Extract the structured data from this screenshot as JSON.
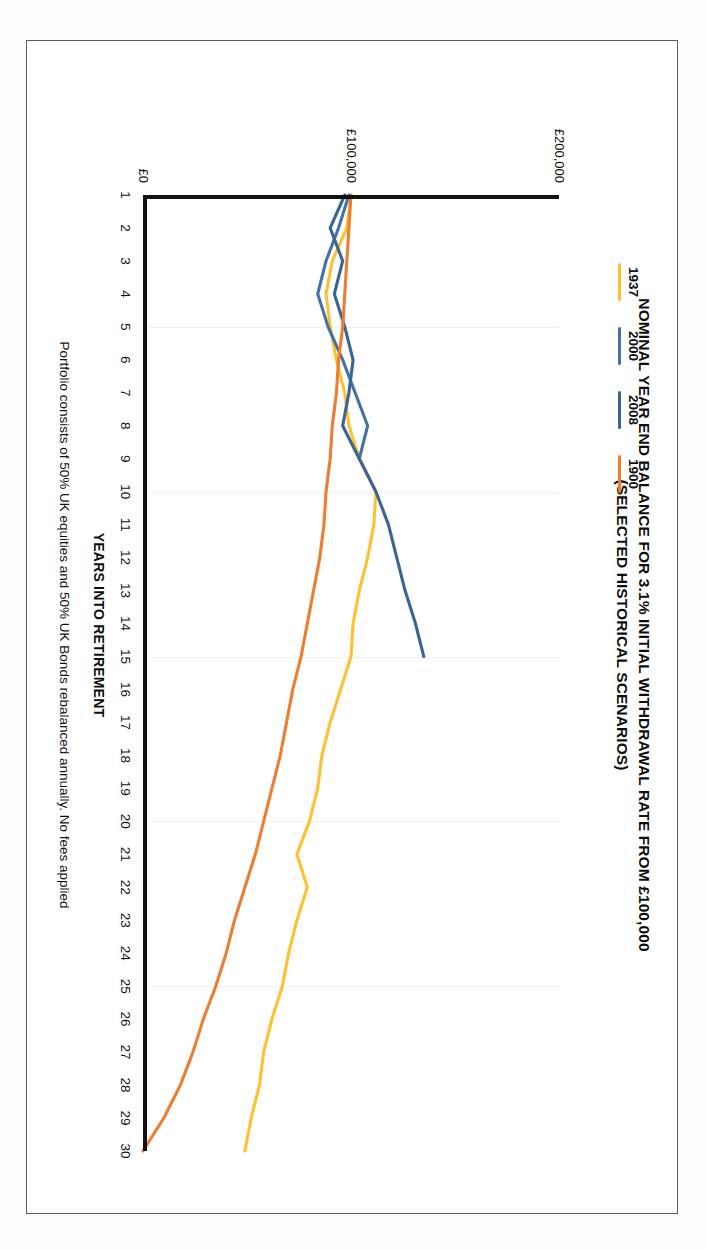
{
  "chart_data": {
    "type": "line",
    "title": "NOMINAL YEAR END BALANCE FOR 3.1% INITIAL WITHDRAWAL RATE FROM £100,000 (SELECTED HISTORICAL SCENARIOS)",
    "title_line1": "NOMINAL YEAR END BALANCE FOR 3.1% INITIAL WITHDRAWAL RATE FROM £100,000",
    "title_line2": "(SELECTED HISTORICAL SCENARIOS)",
    "xlabel": "YEARS INTO RETIREMENT",
    "ylabel": "PORTFOLIO BALANCE",
    "footnote": "Portfolio consists of 50% UK equities and 50% UK Bonds rebalanced annually. No fees applied",
    "grid": true,
    "legend_position": "top-left",
    "xlim": [
      1,
      30
    ],
    "ylim": [
      0,
      200000
    ],
    "yticks": [
      0,
      100000,
      200000
    ],
    "ytick_labels": [
      "£0",
      "£100,000",
      "£200,000"
    ],
    "x": [
      1,
      2,
      3,
      4,
      5,
      6,
      7,
      8,
      9,
      10,
      11,
      12,
      13,
      14,
      15,
      16,
      17,
      18,
      19,
      20,
      21,
      22,
      23,
      24,
      25,
      26,
      27,
      28,
      29,
      30
    ],
    "xtick_labels": [
      "1",
      "2",
      "3",
      "4",
      "5",
      "6",
      "7",
      "8",
      "9",
      "10",
      "11",
      "12",
      "13",
      "14",
      "15",
      "16",
      "17",
      "18",
      "19",
      "20",
      "21",
      "22",
      "23",
      "24",
      "25",
      "26",
      "27",
      "28",
      "29",
      "30"
    ],
    "series": [
      {
        "name": "1937",
        "color": "#FFC12E",
        "values": [
          100000,
          98000,
          91000,
          88000,
          90000,
          93000,
          97000,
          99000,
          104000,
          112000,
          111000,
          108000,
          104000,
          101000,
          100000,
          95000,
          90000,
          86000,
          84000,
          80000,
          74000,
          79000,
          74000,
          70000,
          67000,
          62000,
          58000,
          56000,
          52000,
          49000
        ]
      },
      {
        "name": "2000",
        "color": "#4472A4",
        "values": [
          99000,
          94000,
          88000,
          84000,
          89000,
          96000,
          102000,
          108000,
          104000,
          null,
          null,
          null,
          null,
          null,
          null,
          null,
          null,
          null,
          null,
          null,
          null,
          null,
          null,
          null,
          null,
          null,
          null,
          null,
          null,
          null
        ]
      },
      {
        "name": "2008",
        "color": "#3B6496",
        "values": [
          97000,
          90000,
          96000,
          92000,
          97000,
          101000,
          99000,
          96000,
          104000,
          112000,
          118000,
          122000,
          126000,
          131000,
          135000,
          null,
          null,
          null,
          null,
          null,
          null,
          null,
          null,
          null,
          null,
          null,
          null,
          null,
          null,
          null
        ]
      },
      {
        "name": "1900",
        "color": "#ED7D31",
        "values": [
          100000,
          99000,
          98000,
          97000,
          96000,
          94000,
          93000,
          91000,
          90000,
          88000,
          87000,
          85000,
          82000,
          79000,
          76000,
          72000,
          69000,
          66000,
          62000,
          58000,
          54000,
          49000,
          44000,
          40000,
          35000,
          29000,
          24000,
          18000,
          10000,
          0
        ]
      }
    ]
  },
  "legend": {
    "items": [
      {
        "label": "1937",
        "color": "#FFC12E"
      },
      {
        "label": "2000",
        "color": "#4472A4"
      },
      {
        "label": "2008",
        "color": "#3B6496"
      },
      {
        "label": "1900",
        "color": "#ED7D31"
      }
    ]
  }
}
